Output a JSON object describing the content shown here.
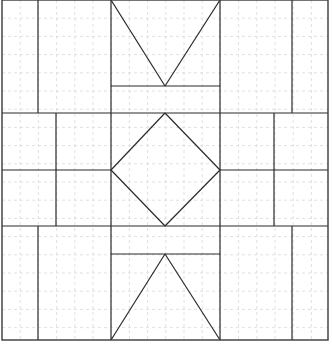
{
  "canvas": {
    "width": 332,
    "height": 351
  },
  "colors": {
    "grid": "#d9d9d9",
    "lines": "#2b2b2b",
    "background": "#ffffff"
  },
  "frame": {
    "x": 2,
    "y": 0,
    "w": 326,
    "h": 340
  },
  "grid": {
    "spacing": 18.2,
    "x_start": 2,
    "x_end": 328,
    "y_start": 0,
    "y_end": 340
  },
  "segments": [
    {
      "name": "top-left-vertical",
      "x1": 38,
      "y1": 0,
      "x2": 38,
      "y2": 113
    },
    {
      "name": "top-center-left-vert",
      "x1": 111,
      "y1": 0,
      "x2": 111,
      "y2": 113
    },
    {
      "name": "top-center-right-vert",
      "x1": 220,
      "y1": 0,
      "x2": 220,
      "y2": 113
    },
    {
      "name": "top-right-vertical",
      "x1": 292,
      "y1": 0,
      "x2": 292,
      "y2": 113
    },
    {
      "name": "top-v-left-arm",
      "x1": 111,
      "y1": 0,
      "x2": 165,
      "y2": 86
    },
    {
      "name": "top-v-right-arm",
      "x1": 220,
      "y1": 0,
      "x2": 165,
      "y2": 86
    },
    {
      "name": "top-bar",
      "x1": 111,
      "y1": 86,
      "x2": 220,
      "y2": 86
    },
    {
      "name": "upper-band-line",
      "x1": 2,
      "y1": 113,
      "x2": 328,
      "y2": 113
    },
    {
      "name": "mid-left-vertical",
      "x1": 56,
      "y1": 113,
      "x2": 56,
      "y2": 226
    },
    {
      "name": "mid-center-left-vert",
      "x1": 111,
      "y1": 113,
      "x2": 111,
      "y2": 226
    },
    {
      "name": "mid-center-right-vert",
      "x1": 220,
      "y1": 113,
      "x2": 220,
      "y2": 226
    },
    {
      "name": "mid-right-vertical",
      "x1": 274,
      "y1": 113,
      "x2": 274,
      "y2": 226
    },
    {
      "name": "mid-left-horizontal",
      "x1": 2,
      "y1": 170,
      "x2": 111,
      "y2": 170
    },
    {
      "name": "mid-right-horizontal",
      "x1": 220,
      "y1": 170,
      "x2": 328,
      "y2": 170
    },
    {
      "name": "diamond-top-left",
      "x1": 165,
      "y1": 113,
      "x2": 111,
      "y2": 170
    },
    {
      "name": "diamond-top-right",
      "x1": 165,
      "y1": 113,
      "x2": 220,
      "y2": 170
    },
    {
      "name": "diamond-bottom-left",
      "x1": 111,
      "y1": 170,
      "x2": 165,
      "y2": 226
    },
    {
      "name": "diamond-bottom-right",
      "x1": 220,
      "y1": 170,
      "x2": 165,
      "y2": 226
    },
    {
      "name": "lower-band-line",
      "x1": 2,
      "y1": 226,
      "x2": 328,
      "y2": 226
    },
    {
      "name": "bottom-left-vertical",
      "x1": 38,
      "y1": 226,
      "x2": 38,
      "y2": 340
    },
    {
      "name": "bottom-center-left-vert",
      "x1": 111,
      "y1": 226,
      "x2": 111,
      "y2": 340
    },
    {
      "name": "bottom-center-right-vert",
      "x1": 220,
      "y1": 226,
      "x2": 220,
      "y2": 340
    },
    {
      "name": "bottom-right-vertical",
      "x1": 292,
      "y1": 226,
      "x2": 292,
      "y2": 340
    },
    {
      "name": "bottom-bar",
      "x1": 111,
      "y1": 254,
      "x2": 220,
      "y2": 254
    },
    {
      "name": "bottom-a-left-arm",
      "x1": 165,
      "y1": 254,
      "x2": 111,
      "y2": 340
    },
    {
      "name": "bottom-a-right-arm",
      "x1": 165,
      "y1": 254,
      "x2": 220,
      "y2": 340
    }
  ]
}
